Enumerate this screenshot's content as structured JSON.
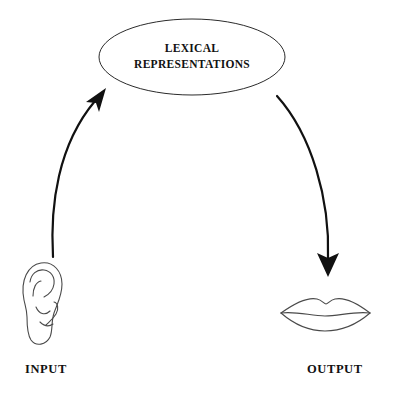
{
  "diagram": {
    "title_node": {
      "shape": "ellipse",
      "line1": "LEXICAL",
      "line2": "REPRESENTATIONS"
    },
    "captions": {
      "input": "INPUT",
      "output": "OUTPUT"
    },
    "icons": {
      "ear": "ear-icon",
      "lips": "lips-icon",
      "arrow_in": "curved-arrow-up-icon",
      "arrow_out": "curved-arrow-down-icon"
    },
    "colors": {
      "background": "#ffffff",
      "ink": "#111111",
      "outline": "#2b2b2b",
      "artwork": "#4a4a4a"
    }
  }
}
